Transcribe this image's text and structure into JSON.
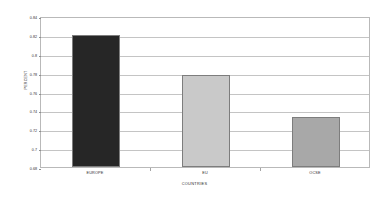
{
  "chart_data": {
    "type": "bar",
    "title": "",
    "categories": [
      "EUROPE",
      "EU",
      "OCSE"
    ],
    "values": [
      0.82,
      0.778,
      0.733
    ],
    "series": [
      {
        "name": "PERCENT",
        "values": [
          0.82,
          0.778,
          0.733
        ]
      }
    ],
    "xlabel": "COUNTRIES",
    "ylabel": "PERCENT",
    "ylim": [
      0.68,
      0.84
    ],
    "ytick_labels": [
      "0.84",
      "0.82",
      "0.8",
      "0.78",
      "0.76",
      "0.74",
      "0.72",
      "0.7",
      "0.68"
    ],
    "ytick_values": [
      0.84,
      0.82,
      0.8,
      0.78,
      0.76,
      0.74,
      0.72,
      0.7,
      0.68
    ],
    "grid": true,
    "legend": false,
    "bar_colors": [
      "#262626",
      "#c9c9c9",
      "#a8a8a8"
    ],
    "bar_border_color": "#7d7d7d",
    "gridline_color": "#c4c4c4",
    "plot_border_color": "#b9b9b9",
    "background_color": "#ffffff"
  }
}
